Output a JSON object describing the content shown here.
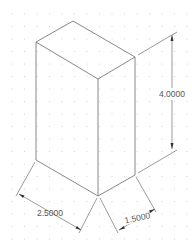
{
  "drawing": {
    "type": "isometric rectangular prism with dimensions",
    "dimensions": {
      "height": "4.0000",
      "width": "2.5000",
      "depth": "1.5000"
    },
    "colors": {
      "background": "#ffffff",
      "lines": "#6a6a6a",
      "grid_dots": "#c8c8c8",
      "text": "#555555"
    }
  }
}
